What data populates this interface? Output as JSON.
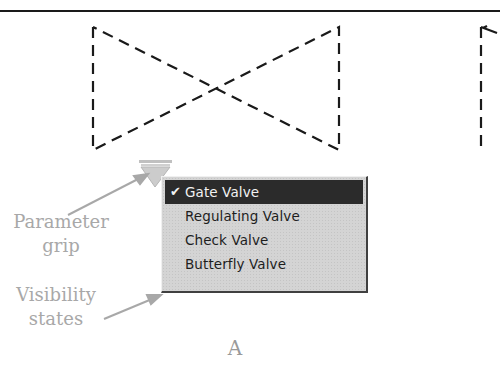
{
  "figure": {
    "label": "A",
    "background": "#ffffff"
  },
  "symbol": {
    "name": "valve block (dashed bowtie)",
    "line_style": "dashed",
    "line_color": "#1a1a1a"
  },
  "parameter_grip": {
    "icon": "inverted-triangle-grip-icon",
    "color": "#c8c8c8"
  },
  "menu": {
    "items": [
      {
        "label": "Gate Valve",
        "checked": true,
        "selected": true
      },
      {
        "label": "Regulating Valve",
        "checked": false,
        "selected": false
      },
      {
        "label": "Check Valve",
        "checked": false,
        "selected": false
      },
      {
        "label": "Butterfly Valve",
        "checked": false,
        "selected": false
      }
    ],
    "check_glyph": "✔",
    "highlight_color": "#2b2b2b"
  },
  "callouts": {
    "parameter_grip": {
      "line1": "Parameter",
      "line2": "grip"
    },
    "visibility_states": {
      "line1": "Visibility",
      "line2": "states"
    },
    "color": "#a8a8a8"
  }
}
